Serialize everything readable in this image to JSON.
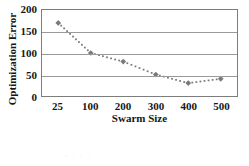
{
  "chart_data": {
    "type": "line",
    "title": "",
    "subtitle": "",
    "xlabel": "Swarm Size",
    "ylabel": "Optimization Error",
    "categories": [
      "25",
      "100",
      "200",
      "300",
      "400",
      "500"
    ],
    "values": [
      170,
      100,
      80,
      50,
      30,
      40
    ],
    "series": [
      {
        "name": "Optimization Error",
        "values": [
          170,
          100,
          80,
          50,
          30,
          40
        ],
        "marker": "diamond",
        "line_style": "dotted",
        "color": "#7a7a7a"
      }
    ],
    "ylim": [
      0,
      200
    ],
    "yticks": [
      0,
      50,
      100,
      150,
      200
    ],
    "ytick_labels": [
      "0",
      "50",
      "100",
      "150",
      "200"
    ],
    "xtick_labels": [
      "25",
      "100",
      "200",
      "300",
      "400",
      "500"
    ],
    "grid": "horizontal",
    "legend": "none",
    "annotations": []
  },
  "style": {
    "axis_color": "#7d7d7d",
    "grid_color": "#9a9a9a",
    "series_color": "#7a7a7a",
    "text_color": "#161616",
    "background": "#ffffff"
  }
}
